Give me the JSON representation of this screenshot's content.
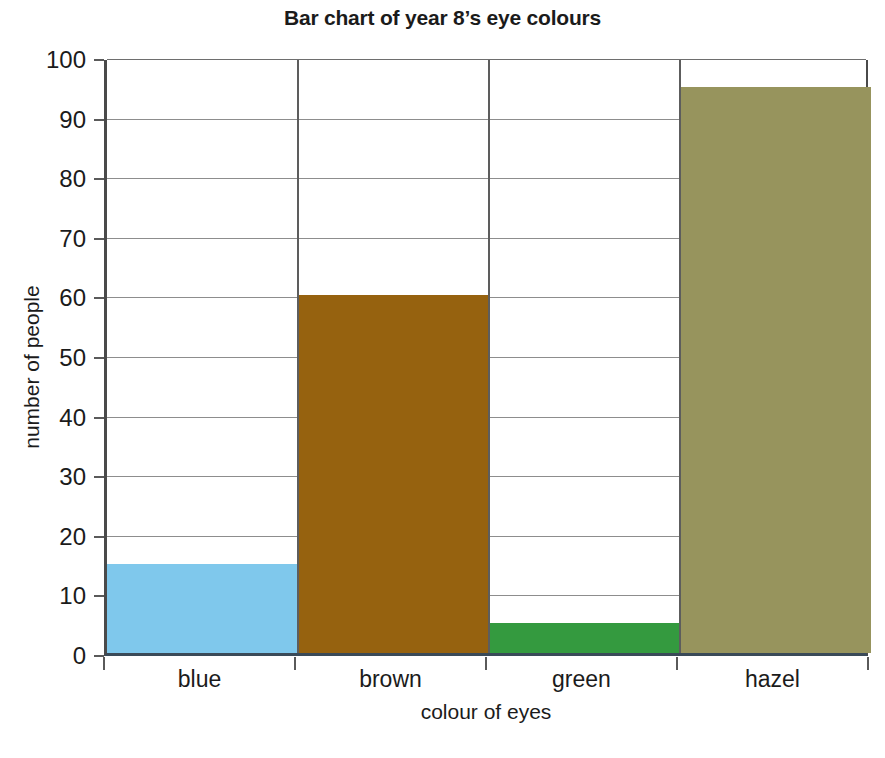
{
  "chart_data": {
    "type": "bar",
    "title": "Bar chart of year 8’s eye colours",
    "xlabel": "colour of eyes",
    "ylabel": "number of people",
    "categories": [
      "blue",
      "brown",
      "green",
      "hazel"
    ],
    "values": [
      15,
      60,
      5,
      95
    ],
    "bar_colors": [
      "#7FC8EC",
      "#96620F",
      "#349A3F",
      "#97945D"
    ],
    "ylim": [
      0,
      100
    ],
    "ytick_labels": [
      "0",
      "10",
      "20",
      "30",
      "40",
      "50",
      "60",
      "70",
      "80",
      "90",
      "100"
    ],
    "ytick_values": [
      0,
      10,
      20,
      30,
      40,
      50,
      60,
      70,
      80,
      90,
      100
    ],
    "grid": "horizontal",
    "legend": "none",
    "bar_gap": "none",
    "series": [
      {
        "name": "number of people",
        "values": [
          15,
          60,
          5,
          95
        ]
      }
    ]
  },
  "axis_colors": {
    "gridline": "#8d8d8d",
    "axis_line": "#4a4a4a",
    "baseline": "#3a4a58",
    "category_divider": "#5d5d5d",
    "text": "#1b1b1b"
  }
}
